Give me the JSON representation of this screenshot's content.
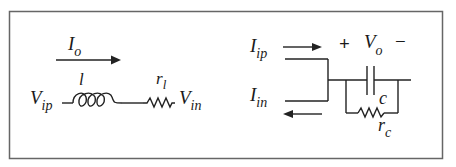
{
  "figure": {
    "type": "circuit-diagram",
    "border_color": "#666666",
    "line_color": "#222222"
  },
  "left_circuit": {
    "current_label": {
      "main": "I",
      "sub": "o"
    },
    "current_direction": "right",
    "inductor_label": "l",
    "resistor_label": {
      "main": "r",
      "sub": "l"
    },
    "input_node": {
      "main": "V",
      "sub": "ip"
    },
    "output_node": {
      "main": "V",
      "sub": "in"
    },
    "components": [
      "inductor",
      "resistor"
    ]
  },
  "right_circuit": {
    "top_current": {
      "main": "I",
      "sub": "ip",
      "direction": "right"
    },
    "bottom_current": {
      "main": "I",
      "sub": "in",
      "direction": "left"
    },
    "voltage_label": {
      "plus": "+",
      "main": "V",
      "sub": "o",
      "minus": "−"
    },
    "capacitor_label": "c",
    "resistor_label": {
      "main": "r",
      "sub": "c"
    },
    "components": [
      "capacitor",
      "parallel-resistor"
    ]
  }
}
